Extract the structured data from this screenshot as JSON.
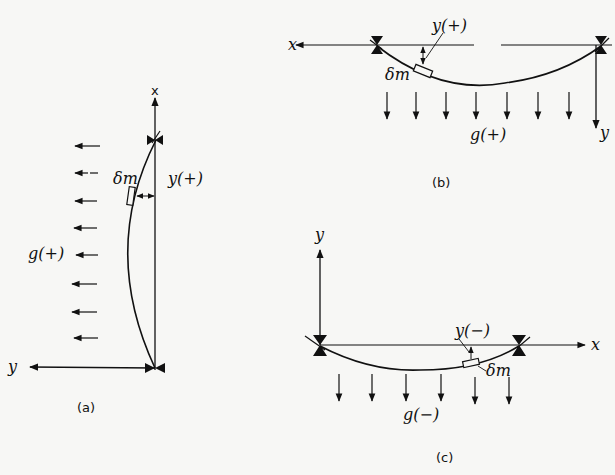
{
  "figure": {
    "panels": [
      {
        "id": "a",
        "caption": "(a)",
        "axes": {
          "x": "x",
          "y": "y"
        },
        "labels": {
          "mass_element": "δm",
          "displacement": "y(+)",
          "gravity": "g(+)"
        },
        "gravity_arrows": 8,
        "orientation": "vertical string, gravity pointing left"
      },
      {
        "id": "b",
        "caption": "(b)",
        "axes": {
          "x": "x",
          "y": "y"
        },
        "labels": {
          "mass_element": "δm",
          "displacement": "y(+)",
          "gravity": "g(+)"
        },
        "gravity_arrows": 7,
        "orientation": "horizontal string, y axis downward"
      },
      {
        "id": "c",
        "caption": "(c)",
        "axes": {
          "x": "x",
          "y": "y"
        },
        "labels": {
          "mass_element": "δm",
          "displacement": "y(−)",
          "gravity": "g(−)"
        },
        "gravity_arrows": 6,
        "orientation": "horizontal string, y axis upward"
      }
    ],
    "colors": {
      "ink": "#111111",
      "paper": "#f7f7f5"
    }
  }
}
